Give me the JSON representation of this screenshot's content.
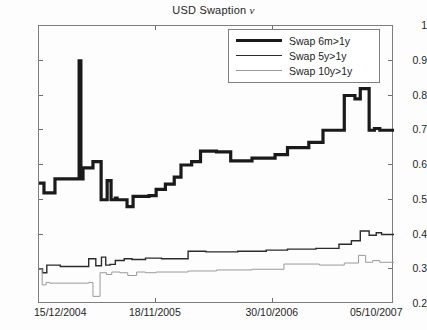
{
  "chart_data": {
    "type": "line",
    "title": "USD Swaption ν",
    "title_prefix": "USD Swaption",
    "title_symbol": "ν",
    "xlabel": "",
    "ylabel": "",
    "ylim": [
      0.2,
      1.0
    ],
    "yticks": [
      0.2,
      0.3,
      0.4,
      0.5,
      0.6,
      0.7,
      0.8,
      0.9,
      1
    ],
    "ytick_labels": [
      "0.2",
      "0.3",
      "0.4",
      "0.5",
      "0.6",
      "0.7",
      "0.8",
      "0.9",
      "1"
    ],
    "xlim": [
      0,
      1
    ],
    "xticks": [
      0.0,
      0.3296,
      0.6592,
      1.0
    ],
    "xtick_labels": [
      "15/12/2004",
      "18/11/2005",
      "30/10/2006",
      "05/10/2007"
    ],
    "grid": false,
    "legend_position": "top-right",
    "legend_entries": [
      "Swap 6m>1y",
      "Swap 5y>1y",
      "Swap 10y>1y"
    ],
    "line_styles": [
      {
        "name": "Swap 6m>1y",
        "width": 3.2,
        "color": "#1a1a1a"
      },
      {
        "name": "Swap 5y>1y",
        "width": 1.4,
        "color": "#2b2b2b"
      },
      {
        "name": "Swap 10y>1y",
        "width": 1.0,
        "color": "#9a9a9a"
      }
    ],
    "series": [
      {
        "name": "Swap 6m>1y",
        "color": "#1a1a1a",
        "width": 3.2,
        "x": [
          0.0,
          0.014,
          0.014,
          0.045,
          0.045,
          0.113,
          0.113,
          0.118,
          0.118,
          0.124,
          0.124,
          0.152,
          0.152,
          0.175,
          0.175,
          0.192,
          0.192,
          0.203,
          0.203,
          0.215,
          0.215,
          0.22,
          0.22,
          0.248,
          0.248,
          0.265,
          0.265,
          0.31,
          0.31,
          0.33,
          0.33,
          0.356,
          0.356,
          0.381,
          0.381,
          0.4,
          0.4,
          0.43,
          0.43,
          0.455,
          0.455,
          0.5,
          0.5,
          0.54,
          0.54,
          0.6,
          0.6,
          0.665,
          0.665,
          0.7,
          0.7,
          0.76,
          0.76,
          0.8,
          0.8,
          0.86,
          0.86,
          0.89,
          0.89,
          0.905,
          0.905,
          0.93,
          0.93,
          0.945,
          0.945,
          0.96,
          0.96,
          1.0
        ],
        "y": [
          0.548,
          0.548,
          0.52,
          0.52,
          0.56,
          0.56,
          0.9,
          0.9,
          0.56,
          0.56,
          0.592,
          0.592,
          0.61,
          0.61,
          0.5,
          0.5,
          0.555,
          0.555,
          0.5,
          0.5,
          0.505,
          0.505,
          0.5,
          0.5,
          0.48,
          0.48,
          0.51,
          0.51,
          0.512,
          0.512,
          0.53,
          0.53,
          0.545,
          0.545,
          0.565,
          0.565,
          0.6,
          0.6,
          0.61,
          0.61,
          0.64,
          0.64,
          0.638,
          0.638,
          0.612,
          0.612,
          0.62,
          0.62,
          0.63,
          0.63,
          0.65,
          0.65,
          0.665,
          0.665,
          0.7,
          0.7,
          0.8,
          0.8,
          0.79,
          0.79,
          0.82,
          0.82,
          0.7,
          0.7,
          0.705,
          0.705,
          0.7,
          0.7
        ]
      },
      {
        "name": "Swap 5y>1y",
        "color": "#2b2b2b",
        "width": 1.4,
        "x": [
          0.0,
          0.01,
          0.01,
          0.022,
          0.022,
          0.06,
          0.06,
          0.14,
          0.14,
          0.16,
          0.16,
          0.176,
          0.176,
          0.188,
          0.188,
          0.2,
          0.2,
          0.215,
          0.215,
          0.24,
          0.24,
          0.262,
          0.262,
          0.3,
          0.3,
          0.345,
          0.345,
          0.42,
          0.42,
          0.47,
          0.47,
          0.56,
          0.56,
          0.64,
          0.64,
          0.7,
          0.7,
          0.78,
          0.78,
          0.845,
          0.845,
          0.88,
          0.88,
          0.905,
          0.905,
          0.93,
          0.93,
          0.95,
          0.95,
          0.965,
          0.965,
          1.0
        ],
        "y": [
          0.3,
          0.3,
          0.29,
          0.29,
          0.312,
          0.312,
          0.308,
          0.308,
          0.33,
          0.33,
          0.31,
          0.31,
          0.335,
          0.335,
          0.312,
          0.312,
          0.314,
          0.314,
          0.325,
          0.325,
          0.33,
          0.33,
          0.328,
          0.328,
          0.332,
          0.332,
          0.33,
          0.33,
          0.352,
          0.352,
          0.35,
          0.35,
          0.352,
          0.352,
          0.355,
          0.355,
          0.358,
          0.358,
          0.36,
          0.36,
          0.372,
          0.372,
          0.382,
          0.382,
          0.41,
          0.41,
          0.398,
          0.398,
          0.405,
          0.405,
          0.4,
          0.4
        ]
      },
      {
        "name": "Swap 10y>1y",
        "color": "#9a9a9a",
        "width": 1.0,
        "x": [
          0.0,
          0.009,
          0.009,
          0.02,
          0.02,
          0.03,
          0.03,
          0.14,
          0.14,
          0.152,
          0.152,
          0.172,
          0.172,
          0.19,
          0.19,
          0.205,
          0.205,
          0.228,
          0.228,
          0.25,
          0.25,
          0.275,
          0.275,
          0.3,
          0.3,
          0.33,
          0.33,
          0.42,
          0.42,
          0.5,
          0.5,
          0.6,
          0.6,
          0.69,
          0.69,
          0.79,
          0.79,
          0.86,
          0.86,
          0.9,
          0.9,
          0.92,
          0.92,
          0.94,
          0.94,
          0.96,
          0.96,
          1.0
        ],
        "y": [
          0.3,
          0.3,
          0.255,
          0.255,
          0.262,
          0.262,
          0.26,
          0.26,
          0.262,
          0.262,
          0.222,
          0.222,
          0.29,
          0.29,
          0.285,
          0.285,
          0.292,
          0.292,
          0.29,
          0.29,
          0.282,
          0.282,
          0.292,
          0.292,
          0.29,
          0.29,
          0.292,
          0.292,
          0.295,
          0.295,
          0.298,
          0.298,
          0.3,
          0.3,
          0.315,
          0.315,
          0.312,
          0.312,
          0.318,
          0.318,
          0.34,
          0.34,
          0.32,
          0.32,
          0.325,
          0.325,
          0.32,
          0.32
        ]
      }
    ]
  }
}
